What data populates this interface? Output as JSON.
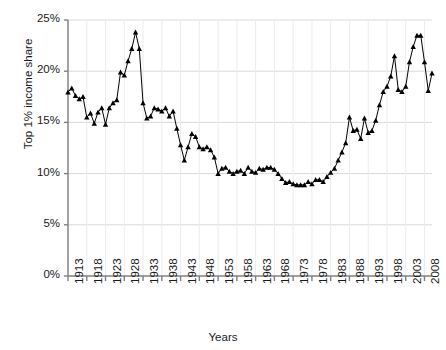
{
  "chart_data": {
    "type": "line",
    "title": "",
    "xlabel": "Years",
    "ylabel": "Top 1% income share",
    "xlim": [
      1913,
      2010
    ],
    "ylim": [
      0,
      25
    ],
    "grid": true,
    "legend": null,
    "marker": "triangle",
    "line_color": "#000000",
    "grid_color": "#d9d9d9",
    "axis_color": "#808080",
    "y_ticks": [
      0,
      5,
      10,
      15,
      20,
      25
    ],
    "y_tick_labels": [
      "0%",
      "5%",
      "10%",
      "15%",
      "20%",
      "25%"
    ],
    "x_ticks": [
      1913,
      1918,
      1923,
      1928,
      1933,
      1938,
      1943,
      1948,
      1953,
      1958,
      1963,
      1968,
      1973,
      1978,
      1983,
      1988,
      1993,
      1998,
      2003,
      2008
    ],
    "x_tick_labels": [
      "1913",
      "1918",
      "1923",
      "1928",
      "1933",
      "1938",
      "1943",
      "1948",
      "1953",
      "1958",
      "1963",
      "1968",
      "1973",
      "1978",
      "1983",
      "1988",
      "1993",
      "1998",
      "2003",
      "2008"
    ],
    "x": [
      1913,
      1914,
      1915,
      1916,
      1917,
      1918,
      1919,
      1920,
      1921,
      1922,
      1923,
      1924,
      1925,
      1926,
      1927,
      1928,
      1929,
      1930,
      1931,
      1932,
      1933,
      1934,
      1935,
      1936,
      1937,
      1938,
      1939,
      1940,
      1941,
      1942,
      1943,
      1944,
      1945,
      1946,
      1947,
      1948,
      1949,
      1950,
      1951,
      1952,
      1953,
      1954,
      1955,
      1956,
      1957,
      1958,
      1959,
      1960,
      1961,
      1962,
      1963,
      1964,
      1965,
      1966,
      1967,
      1968,
      1969,
      1970,
      1971,
      1972,
      1973,
      1974,
      1975,
      1976,
      1977,
      1978,
      1979,
      1980,
      1981,
      1982,
      1983,
      1984,
      1985,
      1986,
      1987,
      1988,
      1989,
      1990,
      1991,
      1992,
      1993,
      1994,
      1995,
      1996,
      1997,
      1998,
      1999,
      2000,
      2001,
      2002,
      2003,
      2004,
      2005,
      2006,
      2007,
      2008,
      2009,
      2010
    ],
    "y": [
      17.96,
      18.35,
      17.6,
      17.3,
      17.5,
      15.5,
      15.9,
      14.9,
      16.0,
      16.4,
      14.8,
      16.4,
      16.9,
      17.2,
      19.9,
      19.6,
      21.0,
      22.2,
      23.8,
      22.2,
      16.9,
      15.4,
      15.6,
      16.4,
      16.3,
      16.1,
      16.4,
      15.6,
      16.1,
      14.4,
      12.8,
      11.3,
      12.6,
      13.9,
      13.6,
      12.6,
      12.4,
      12.6,
      12.3,
      11.6,
      10.0,
      10.5,
      10.6,
      10.2,
      10.0,
      10.2,
      10.3,
      10.0,
      10.6,
      10.2,
      10.1,
      10.5,
      10.4,
      10.6,
      10.6,
      10.4,
      10.0,
      9.5,
      9.1,
      9.2,
      9.0,
      8.9,
      8.9,
      8.9,
      9.2,
      9.0,
      9.4,
      9.4,
      9.2,
      9.7,
      10.1,
      10.5,
      11.3,
      12.1,
      13.0,
      15.5,
      14.2,
      14.3,
      13.4,
      15.4,
      14.0,
      14.2,
      15.2,
      16.7,
      18.0,
      18.5,
      19.5,
      21.5,
      18.2,
      18.0,
      18.5,
      20.9,
      22.4,
      23.5,
      23.5,
      20.9,
      18.1,
      19.8
    ],
    "source_note": ""
  },
  "axis": {
    "y_axis_name": "y-axis",
    "x_axis_name": "x-axis"
  }
}
